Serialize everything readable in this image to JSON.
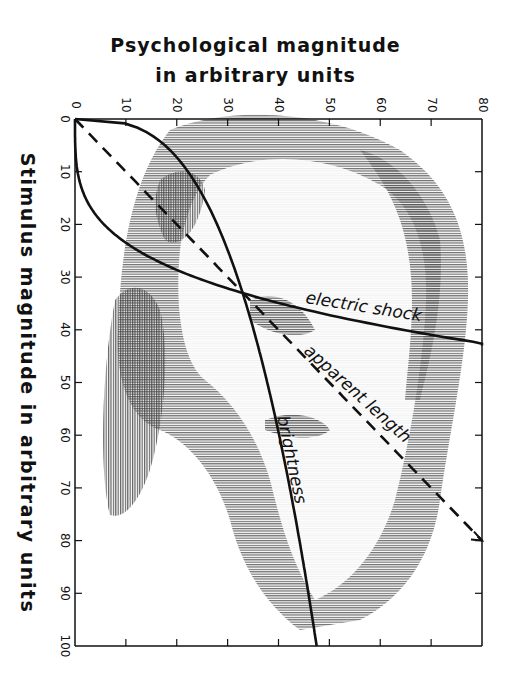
{
  "chart_data": {
    "type": "line",
    "title_lines": [
      "Psychological magnitude",
      "in arbitrary units"
    ],
    "xlabel": "Stimulus magnitude in arbitrary units",
    "ylabel": "Psychological magnitude in arbitrary units",
    "orientation": "rotated 90° clockwise: stimulus axis runs top-to-bottom on the left, psychological axis runs left-to-right on the top",
    "x_axis": {
      "name": "Stimulus magnitude",
      "range": [
        0,
        100
      ],
      "ticks": [
        0,
        10,
        20,
        30,
        40,
        50,
        60,
        70,
        80,
        90,
        100
      ]
    },
    "y_axis": {
      "name": "Psychological magnitude",
      "range": [
        0,
        80
      ],
      "ticks": [
        0,
        10,
        20,
        30,
        40,
        50,
        60,
        70,
        80
      ]
    },
    "grid": false,
    "legend": "inline labels",
    "series": [
      {
        "name": "electric shock",
        "style": "solid",
        "exponent": 3.5,
        "x": [
          0,
          10,
          20,
          25,
          30,
          33,
          36,
          40,
          43
        ],
        "values": [
          0,
          0.5,
          5.4,
          11.7,
          23.0,
          33.0,
          44.5,
          64.6,
          83.0
        ]
      },
      {
        "name": "apparent length",
        "style": "dashed",
        "exponent": 1.0,
        "x": [
          0,
          20,
          40,
          60,
          80
        ],
        "values": [
          0,
          20,
          40,
          60,
          80
        ]
      },
      {
        "name": "brightness",
        "style": "solid",
        "exponent": 0.33,
        "x": [
          0,
          1,
          5,
          10,
          20,
          33,
          50,
          70,
          100
        ],
        "values": [
          0,
          10.2,
          17.4,
          21.9,
          27.7,
          33.0,
          37.8,
          42.3,
          47.5
        ]
      }
    ],
    "annotations": [
      "electric shock",
      "apparent length",
      "brightness"
    ],
    "background": "halftone portrait of a man's face behind the plot"
  },
  "axes": {
    "top_ticks": [
      "0",
      "10",
      "20",
      "30",
      "40",
      "50",
      "60",
      "70",
      "80"
    ],
    "left_ticks": [
      "0",
      "10",
      "20",
      "30",
      "40",
      "50",
      "60",
      "70",
      "80",
      "90",
      "100"
    ]
  },
  "labels": {
    "title_line1": "Psychological magnitude",
    "title_line2": "in arbitrary units",
    "side": "Stimulus magnitude in arbitrary units",
    "electric": "electric shock",
    "length": "apparent length",
    "brightness": "brightness"
  },
  "colors": {
    "ink": "#111111",
    "halftone": "#555555",
    "background": "#ffffff"
  }
}
